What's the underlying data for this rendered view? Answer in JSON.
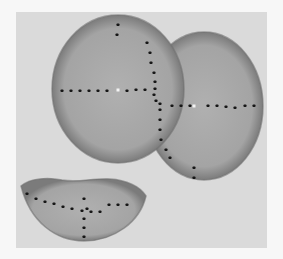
{
  "canvas": {
    "width": 283,
    "height": 259,
    "outer_bg": "#f7f7f7"
  },
  "panel": {
    "x": 16,
    "y": 12,
    "width": 251,
    "height": 236,
    "fill": "#dadada"
  },
  "colors": {
    "shape_fill": "#a9a9a9",
    "shape_rim": "#6f6f6f",
    "dot": "#161616",
    "center_dot": "#f4f4f4"
  },
  "shapes": {
    "right_circle": {
      "cx": 204,
      "cy": 106,
      "rx": 59,
      "ry": 74
    },
    "left_circle": {
      "cx": 118,
      "cy": 89,
      "rx": 66,
      "ry": 74
    },
    "bowl": {
      "path": "M21,186 C30,178 48,177 62,180 C78,183 92,178 110,179 C126,180 140,186 146,196 C140,222 114,241 84,241 C56,241 30,222 21,186 Z"
    }
  },
  "dot_size": 3,
  "dots": {
    "left_circle_horizontal": [
      [
        62,
        91
      ],
      [
        71,
        91
      ],
      [
        80,
        91
      ],
      [
        89,
        91
      ],
      [
        98,
        91
      ],
      [
        107,
        91
      ],
      [
        127,
        91
      ],
      [
        136,
        90
      ],
      [
        145,
        90
      ]
    ],
    "left_circle_top": [
      [
        118,
        25
      ],
      [
        117,
        35
      ]
    ],
    "cleavage_vertical": [
      [
        147,
        43
      ],
      [
        150,
        53
      ],
      [
        151,
        63
      ],
      [
        154,
        73
      ],
      [
        155,
        82
      ],
      [
        155,
        89
      ],
      [
        154,
        95
      ],
      [
        156,
        101
      ],
      [
        160,
        104
      ],
      [
        160,
        110
      ],
      [
        160,
        120
      ],
      [
        160,
        130
      ],
      [
        161,
        140
      ],
      [
        166,
        150
      ],
      [
        170,
        158
      ]
    ],
    "right_circle_horizontal": [
      [
        172,
        106
      ],
      [
        181,
        106
      ],
      [
        190,
        106
      ],
      [
        208,
        106
      ],
      [
        217,
        106
      ],
      [
        226,
        107
      ],
      [
        235,
        108
      ],
      [
        245,
        106
      ],
      [
        254,
        106
      ]
    ],
    "right_circle_bottom": [
      [
        194,
        168
      ],
      [
        194,
        178
      ]
    ],
    "bowl_horizontal": [
      [
        27,
        194
      ],
      [
        36,
        199
      ],
      [
        45,
        202
      ],
      [
        54,
        204
      ],
      [
        63,
        207
      ],
      [
        72,
        209
      ],
      [
        82,
        211
      ],
      [
        87,
        209
      ],
      [
        91,
        212
      ],
      [
        100,
        212
      ],
      [
        109,
        205
      ],
      [
        118,
        205
      ],
      [
        127,
        205
      ]
    ],
    "bowl_vertical": [
      [
        84,
        199
      ],
      [
        84,
        219
      ],
      [
        84,
        228
      ],
      [
        84,
        237
      ]
    ]
  },
  "center_points": [
    [
      118,
      90
    ],
    [
      194,
      106
    ]
  ]
}
